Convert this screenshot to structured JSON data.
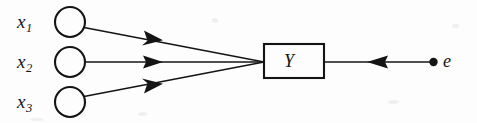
{
  "diagram": {
    "type": "path-diagram",
    "background_color": "#fdfdfd",
    "ink_color": "#141414",
    "stroke_width": 1.6,
    "predictors": [
      {
        "id": "x1",
        "label": "x",
        "subscript": "1",
        "label_text": "x₁",
        "shape": "circle",
        "cx": 70,
        "cy": 22,
        "r": 15
      },
      {
        "id": "x2",
        "label": "x",
        "subscript": "2",
        "label_text": "x₂",
        "shape": "circle",
        "cx": 70,
        "cy": 62,
        "r": 15
      },
      {
        "id": "x3",
        "label": "x",
        "subscript": "3",
        "label_text": "x₃",
        "shape": "circle",
        "cx": 70,
        "cy": 102,
        "r": 15
      }
    ],
    "outcome": {
      "id": "y",
      "label": "Y",
      "shape": "rectangle",
      "x": 264,
      "y": 44,
      "width": 60,
      "height": 34
    },
    "error": {
      "id": "e",
      "label": "e",
      "shape": "filled-dot",
      "cx": 434,
      "cy": 62,
      "r": 4
    },
    "edges": [
      {
        "id": "x1-to-y",
        "from": "x1",
        "to": "y",
        "direction": "forward",
        "x1": 85,
        "y1": 27,
        "x2": 264,
        "y2": 62,
        "arrow_t": 0.39
      },
      {
        "id": "x2-to-y",
        "from": "x2",
        "to": "y",
        "direction": "forward",
        "x1": 85,
        "y1": 62,
        "x2": 264,
        "y2": 62,
        "arrow_t": 0.39
      },
      {
        "id": "x3-to-y",
        "from": "x3",
        "to": "y",
        "direction": "forward",
        "x1": 85,
        "y1": 97,
        "x2": 264,
        "y2": 62,
        "arrow_t": 0.39
      },
      {
        "id": "e-to-y",
        "from": "e",
        "to": "y",
        "direction": "backward",
        "x1": 430,
        "y1": 62,
        "x2": 325,
        "y2": 62,
        "arrow_t": 0.56
      }
    ]
  }
}
